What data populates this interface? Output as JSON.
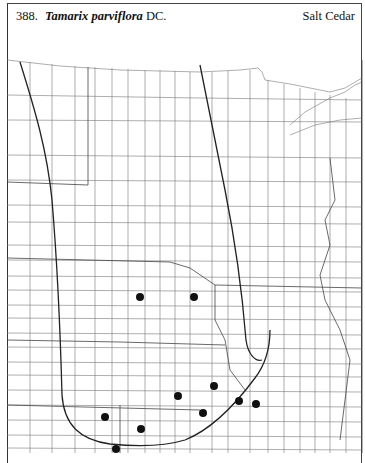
{
  "header": {
    "number": "388.",
    "scientific_name": "Tamarix parviflora",
    "authority": "DC.",
    "common_name": "Salt Cedar"
  },
  "map": {
    "region": "Great Plains county map",
    "line_color": "#555555",
    "range_line_color": "#222222",
    "dot_color": "#111111",
    "occurrence_dots": [
      {
        "x": 140,
        "y": 297
      },
      {
        "x": 194,
        "y": 297
      },
      {
        "x": 214,
        "y": 386
      },
      {
        "x": 178,
        "y": 396
      },
      {
        "x": 239,
        "y": 401
      },
      {
        "x": 256,
        "y": 404
      },
      {
        "x": 203,
        "y": 413
      },
      {
        "x": 105,
        "y": 417
      },
      {
        "x": 141,
        "y": 429
      },
      {
        "x": 116,
        "y": 449
      }
    ]
  }
}
